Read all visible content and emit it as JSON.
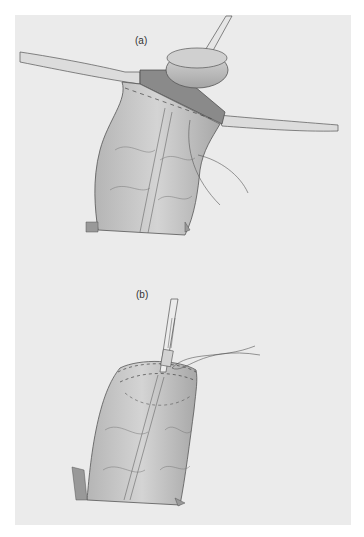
{
  "figure": {
    "panel_a": {
      "label": "(a)",
      "description": "Bowel segment pulled through abdominal wall with purse-string sutures, circular stapler anvil being inserted"
    },
    "panel_b": {
      "label": "(b)",
      "description": "Anvil shaft within bowel with purse-string suture tightened around it"
    }
  },
  "colors": {
    "background": "#ffffff",
    "panel": "#ebebeb",
    "ink": "#4a4a4a",
    "tissue": "#c9c9c9",
    "tissue_dark": "#8f8f8f"
  }
}
